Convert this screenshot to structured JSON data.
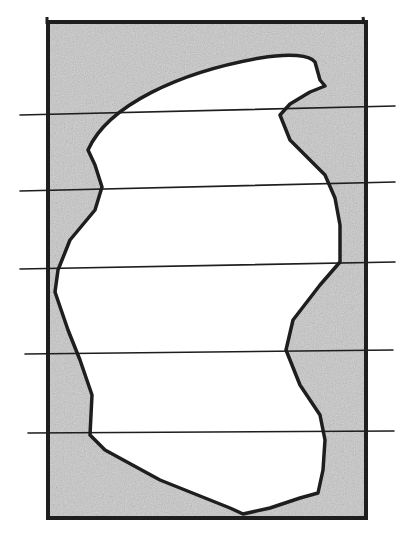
{
  "figure": {
    "colors": {
      "background": "#ffffff",
      "shading": "#c9c9c9",
      "ink": "#1e1e1e",
      "blob_fill": "#ffffff"
    },
    "frame": {
      "x": 48,
      "y": 22,
      "width": 318,
      "height": 496
    },
    "horizontal_lines": [
      {
        "x1": 20,
        "y1": 115,
        "x2": 395,
        "y2": 106
      },
      {
        "x1": 20,
        "y1": 191,
        "x2": 395,
        "y2": 182
      },
      {
        "x1": 20,
        "y1": 269,
        "x2": 395,
        "y2": 262
      },
      {
        "x1": 25,
        "y1": 354,
        "x2": 393,
        "y2": 350
      },
      {
        "x1": 28,
        "y1": 433,
        "x2": 394,
        "y2": 431
      }
    ],
    "blob_path": "M 88 150 C 108 105, 180 72, 260 58 C 290 53, 310 55, 315 62 L 320 80 L 325 86 L 310 92 L 300 98 L 290 104 L 280 115 L 290 140 L 325 175 L 335 198 L 340 225 L 340 262 L 320 285 L 293 320 L 286 350 L 300 385 L 320 415 L 325 440 L 323 470 L 318 493 L 300 498 L 270 508 L 243 514 L 230 508 L 160 480 L 105 450 L 90 435 L 92 395 L 80 360 L 68 330 L 55 292 L 58 270 L 70 240 L 95 210 L 102 187 L 95 165 Z"
  }
}
